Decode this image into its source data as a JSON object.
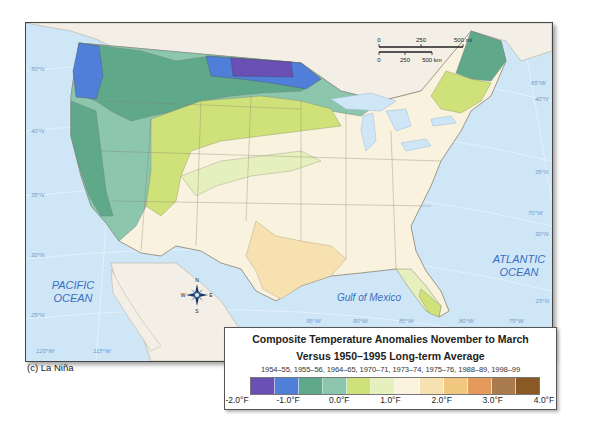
{
  "figure": {
    "caption": "(c) La Niña"
  },
  "map": {
    "labels": {
      "pacific": [
        "PACIFIC",
        "OCEAN"
      ],
      "atlantic": [
        "ATLANTIC",
        "OCEAN"
      ],
      "gulf": "Gulf of Mexico"
    },
    "latitudes_left": [
      "50°N",
      "40°N",
      "35°N",
      "30°N",
      "25°N"
    ],
    "latitudes_right": [
      "40°N",
      "35°N",
      "30°N",
      "25°N"
    ],
    "longitudes_bottom": [
      "120°W",
      "115°W",
      "95°W",
      "90°W",
      "85°W",
      "80°W",
      "75°W"
    ],
    "longitudes_right": [
      "65°W",
      "70°W"
    ],
    "scale_bar": {
      "mi_ticks": [
        "0",
        "250",
        "500 mi"
      ],
      "km_ticks": [
        "0",
        "250",
        "500 km"
      ]
    },
    "compass": {
      "n": "N",
      "s": "S",
      "e": "E",
      "w": "W"
    }
  },
  "legend": {
    "title_line1": "Composite Temperature Anomalies November to March",
    "title_line2": "Versus 1950–1995 Long-term Average",
    "years": "1954–55, 1955–56, 1964–65, 1970–71, 1973–74, 1975–76, 1988–89, 1998–99",
    "colors": [
      "#6a4fb5",
      "#4f7fd8",
      "#5fa88a",
      "#8cc6ad",
      "#cfe27a",
      "#e6f0bf",
      "#fbf3dd",
      "#f8e1b0",
      "#f1c77f",
      "#e39a5a",
      "#a97b4f",
      "#8a5a24"
    ],
    "ticks": [
      "-2.0°F",
      "-1.0°F",
      "0.0°F",
      "1.0°F",
      "2.0°F",
      "3.0°F",
      "4.0°F"
    ]
  }
}
